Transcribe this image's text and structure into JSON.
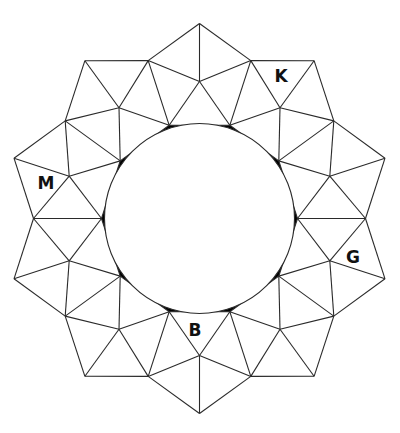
{
  "diagram": {
    "type": "decagonal-tiling-ring",
    "symmetry": 10,
    "center": [
      199.5,
      218.5
    ],
    "colors": {
      "stroke": "#2a2a2a",
      "background": "#ffffff",
      "cusp_fill": "#000000"
    },
    "rings": {
      "inner_radius": 98,
      "inner_angle_offset_deg": 0,
      "mid_radius": 137,
      "mid_angle_offset_deg": 18,
      "shoulder_radius": 166,
      "shoulder_angle_offset_deg": 0,
      "apex_radius": 195,
      "apex_angle_offset_deg": 18
    },
    "inner_circle_radius": 95,
    "labels": [
      {
        "text": "K",
        "x": 281,
        "y": 82
      },
      {
        "text": "M",
        "x": 46,
        "y": 189
      },
      {
        "text": "G",
        "x": 353,
        "y": 263
      },
      {
        "text": "B",
        "x": 195,
        "y": 336
      }
    ]
  }
}
